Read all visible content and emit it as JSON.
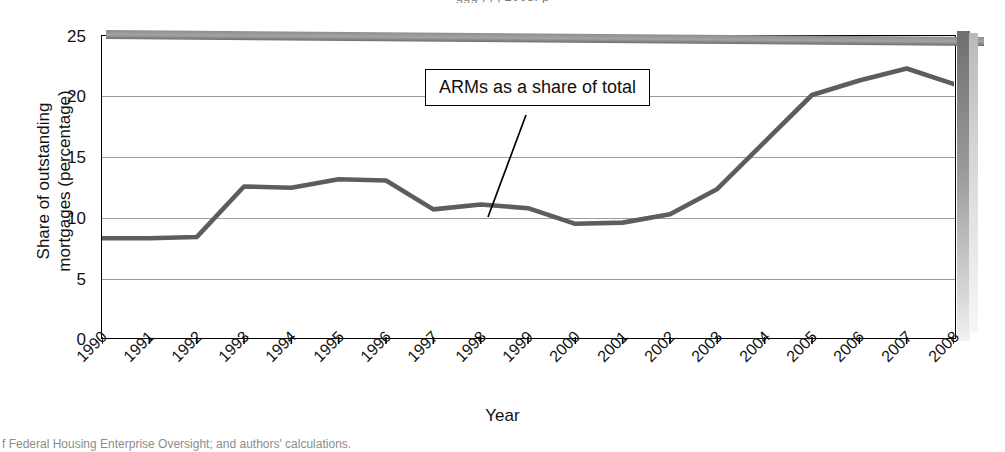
{
  "figure": {
    "top_caption_remnant": "ggg  ,       ,                 ,       2008.       p",
    "bottom_caption_remnant": "f Federal Housing Enterprise Oversight; and authors' calculations."
  },
  "chart_data": {
    "type": "line",
    "title": "",
    "xlabel": "Year",
    "ylabel": "Share of outstanding mortgages (percentage)",
    "ylim": [
      0,
      25
    ],
    "yticks": [
      0,
      5,
      10,
      15,
      20,
      25
    ],
    "grid": true,
    "legend_position": "none",
    "annotations": [
      {
        "text": "ARMs as a share of total",
        "points_to_x": "1999",
        "points_to_y": 10.6
      }
    ],
    "categories": [
      "1990",
      "1991",
      "1992",
      "1993",
      "1994",
      "1995",
      "1996",
      "1997",
      "1998",
      "1999",
      "2000",
      "2001",
      "2002",
      "2003",
      "2004",
      "2005",
      "2006",
      "2007",
      "2008"
    ],
    "series": [
      {
        "name": "ARMs as a share of total",
        "color": "#5d5d5d",
        "values": [
          8.2,
          8.2,
          8.3,
          12.5,
          12.4,
          13.1,
          13.0,
          10.6,
          11.0,
          10.7,
          9.4,
          9.5,
          10.2,
          12.3,
          16.2,
          20.1,
          21.3,
          22.3,
          21.0
        ]
      }
    ]
  },
  "axis": {
    "ylabel_line1": "Share of outstanding",
    "ylabel_line2": "mortgages (percentage)"
  }
}
